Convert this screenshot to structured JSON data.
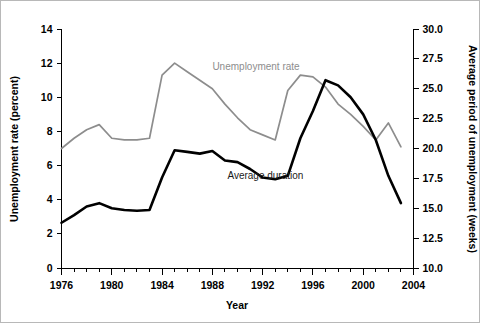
{
  "chart_data": {
    "type": "line",
    "title": "",
    "xlabel": "Year",
    "ylabel": "Unemployment rate (percent)",
    "ylabel_right": "Average period of unemployment (weeks)",
    "xlim": [
      1976,
      2004
    ],
    "ylim": [
      0,
      14
    ],
    "ylim_right": [
      10.0,
      30.0
    ],
    "grid": false,
    "legend_position": "inline-annotation",
    "xticks": [
      1976,
      1980,
      1984,
      1988,
      1992,
      1996,
      2000,
      2004
    ],
    "xtick_labels": [
      "1976",
      "1980",
      "1984",
      "1988",
      "1992",
      "1996",
      "2000",
      "2004"
    ],
    "xminor_step": 1,
    "yticks": [
      0,
      2,
      4,
      6,
      8,
      10,
      12,
      14
    ],
    "ytick_labels": [
      "0",
      "2",
      "4",
      "6",
      "8",
      "10",
      "12",
      "14"
    ],
    "yticks_right": [
      10.0,
      12.5,
      15.0,
      17.5,
      20.0,
      22.5,
      25.0,
      27.5,
      30.0
    ],
    "ytick_labels_right": [
      "10.0",
      "12.5",
      "15.0",
      "17.5",
      "20.0",
      "22.5",
      "25.0",
      "27.5",
      "30.0"
    ],
    "x": [
      1976,
      1977,
      1978,
      1979,
      1980,
      1981,
      1982,
      1983,
      1984,
      1985,
      1986,
      1987,
      1988,
      1989,
      1990,
      1991,
      1992,
      1993,
      1994,
      1995,
      1996,
      1997,
      1998,
      1999,
      2000,
      2001,
      2002,
      2003
    ],
    "series": [
      {
        "name": "Unemployment rate",
        "axis": "left",
        "units": "percent",
        "color": "#8d8d8d",
        "label_x": 1988,
        "label_y": 11.6,
        "values": [
          7.0,
          7.6,
          8.1,
          8.4,
          7.6,
          7.5,
          7.5,
          7.6,
          11.3,
          12.0,
          11.5,
          11.0,
          10.5,
          9.6,
          8.8,
          8.1,
          7.8,
          7.5,
          10.4,
          11.3,
          11.2,
          10.6,
          9.6,
          9.0,
          8.3,
          7.5,
          8.5,
          7.1
        ]
      },
      {
        "name": "Average duration",
        "axis": "right",
        "units": "weeks",
        "color": "#000000",
        "label_x": 1989.2,
        "label_y": 5.2,
        "values_weeks": [
          15.5,
          16.2,
          17.0,
          17.4,
          16.8,
          16.6,
          16.5,
          16.6,
          19.3,
          21.3,
          21.2,
          21.0,
          21.2,
          20.5,
          20.4,
          19.7,
          18.9,
          18.7,
          19.0,
          22.1,
          24.4,
          25.7,
          25.3,
          24.3,
          22.8,
          20.7,
          17.8,
          15.3
        ],
        "values_left_scale": [
          2.65,
          3.1,
          3.6,
          3.8,
          3.5,
          3.4,
          3.35,
          3.4,
          5.3,
          6.9,
          6.8,
          6.7,
          6.85,
          6.3,
          6.2,
          5.8,
          5.3,
          5.2,
          5.4,
          7.6,
          9.2,
          11.0,
          10.7,
          10.0,
          9.0,
          7.5,
          5.4,
          3.8
        ]
      }
    ],
    "series_endpoints_note": {
      "gray_end_value": 7.5,
      "black_end_value_weeks": 16.1
    }
  },
  "annotations": {
    "gray_label": "Unemployment rate",
    "black_label": "Average duration"
  }
}
